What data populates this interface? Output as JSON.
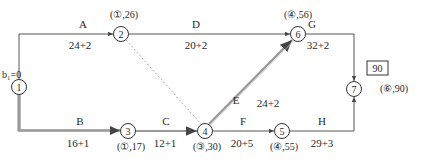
{
  "diagram": {
    "type": "network-schedule",
    "start_label": "b₁=0",
    "total_box": "90",
    "nodes": [
      {
        "id": "1",
        "x": 19,
        "y": 87,
        "annotation": ""
      },
      {
        "id": "2",
        "x": 121,
        "y": 34,
        "annotation": "(①,26)"
      },
      {
        "id": "3",
        "x": 128,
        "y": 131,
        "annotation": "(①,17)"
      },
      {
        "id": "4",
        "x": 205,
        "y": 131,
        "annotation": "(③,30)"
      },
      {
        "id": "5",
        "x": 282,
        "y": 131,
        "annotation": "(④,55)"
      },
      {
        "id": "6",
        "x": 298,
        "y": 34,
        "annotation": "(④,56)"
      },
      {
        "id": "7",
        "x": 354,
        "y": 89,
        "annotation": "(⑥,90)"
      }
    ],
    "activities": [
      {
        "name": "A",
        "from": "1",
        "to": "2",
        "duration": "24+2",
        "critical": false
      },
      {
        "name": "B",
        "from": "1",
        "to": "3",
        "duration": "16+1",
        "critical": true
      },
      {
        "name": "C",
        "from": "3",
        "to": "4",
        "duration": "12+1",
        "critical": true
      },
      {
        "name": "D",
        "from": "2",
        "to": "6",
        "duration": "20+2",
        "critical": false
      },
      {
        "name": "E",
        "from": "4",
        "to": "6",
        "duration": "24+2",
        "critical": true
      },
      {
        "name": "F",
        "from": "4",
        "to": "5",
        "duration": "20+5",
        "critical": false
      },
      {
        "name": "G",
        "from": "6",
        "to": "7",
        "duration": "32+2",
        "critical": false
      },
      {
        "name": "H",
        "from": "5",
        "to": "7",
        "duration": "29+3",
        "critical": false
      }
    ],
    "dummy": [
      {
        "from": "2",
        "to": "4"
      }
    ],
    "colors": {
      "line": "#555555",
      "critical": "#9a9a9a",
      "dummy": "#b0b0b0",
      "text": "#2a2a2a"
    }
  }
}
